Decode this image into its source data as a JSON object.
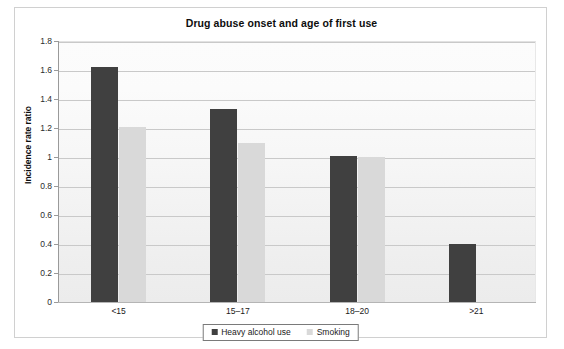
{
  "chart_data": {
    "type": "bar",
    "title": "Drug abuse onset and age of first use",
    "xlabel": "",
    "ylabel": "Incidence rate ratio",
    "categories": [
      "<15",
      "15–17",
      "18–20",
      ">21"
    ],
    "series": [
      {
        "name": "Heavy alcohol use",
        "color": "#404040",
        "values": [
          1.62,
          1.33,
          1.01,
          0.4
        ]
      },
      {
        "name": "Smoking",
        "color": "#d9d9d9",
        "values": [
          1.21,
          1.1,
          1.0,
          null
        ]
      }
    ],
    "ylim": [
      0,
      1.8
    ],
    "ytick_step": 0.2,
    "yticks": [
      "1.8",
      "1.6",
      "1.4",
      "1.2",
      "1",
      "0.8",
      "0.6",
      "0.4",
      "0.2",
      "0"
    ],
    "ytick_values": [
      1.8,
      1.6,
      1.4,
      1.2,
      1.0,
      0.8,
      0.6,
      0.4,
      0.2,
      0
    ],
    "grid": true,
    "grid_axis": "y",
    "legend_position": "bottom-center"
  },
  "legend": {
    "items": [
      {
        "label": "Heavy alcohol use",
        "swatch": "series-alcohol"
      },
      {
        "label": "Smoking",
        "swatch": "series-smoking"
      }
    ]
  }
}
